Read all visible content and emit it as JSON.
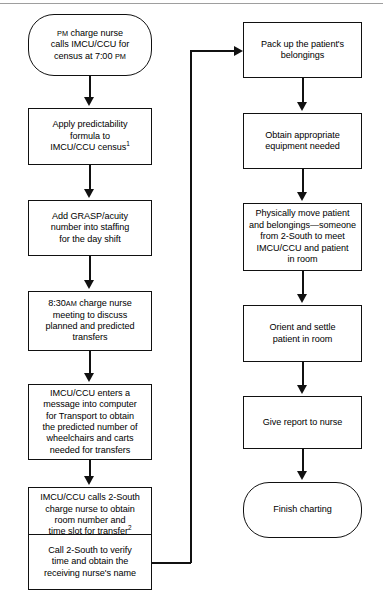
{
  "diagram": {
    "background": "#ffffff",
    "line_color": "#111111",
    "nodes": {
      "n1": {
        "shape": "terminator",
        "label": "PM charge nurse\ncalls IMCU/CCU for\ncensus at 7:00 PM"
      },
      "n2": {
        "shape": "process",
        "label": "Apply predictability\nformula to\nIMCU/CCU census",
        "footnote": "1"
      },
      "n3": {
        "shape": "process",
        "label": "Add GRASP/acuity\nnumber into staffing\nfor the day shift"
      },
      "n4": {
        "shape": "process",
        "label": "8:30AM charge nurse\nmeeting to discuss\nplanned and predicted\ntransfers"
      },
      "n5": {
        "shape": "process",
        "label": "IMCU/CCU enters a\nmessage into computer\nfor Transport to obtain\nthe predicted number of\nwheelchairs and carts\nneeded for transfers"
      },
      "n6": {
        "shape": "process",
        "label": "IMCU/CCU calls 2-South\ncharge nurse to obtain\nroom number and\ntime slot for transfer",
        "footnote": "2"
      },
      "n7": {
        "shape": "process",
        "label": "Call 2-South to verify\ntime and obtain the\nreceiving nurse's name"
      },
      "n8": {
        "shape": "process",
        "label": "Pack up the patient's\nbelongings"
      },
      "n9": {
        "shape": "process",
        "label": "Obtain appropriate\nequipment needed"
      },
      "n10": {
        "shape": "process",
        "label": "Physically move patient\nand belongings—someone\nfrom 2-South to meet\nIMCU/CCU and patient\nin room"
      },
      "n11": {
        "shape": "process",
        "label": "Orient and settle\npatient in room"
      },
      "n12": {
        "shape": "process",
        "label": "Give report to nurse"
      },
      "n13": {
        "shape": "terminator",
        "label": "Finish charting"
      }
    }
  }
}
